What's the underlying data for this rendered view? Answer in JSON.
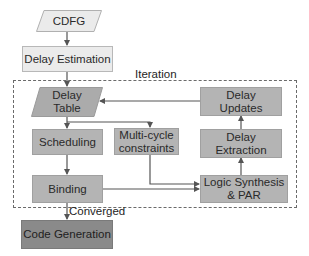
{
  "diagram": {
    "colors": {
      "light_fill": "#ebebeb",
      "mid_fill": "#b4b4b4",
      "dark_fill": "#8a8a8a",
      "line": "#555555",
      "frame": "#6a6a6a"
    },
    "nodes": {
      "cdfg": {
        "label": "CDFG",
        "shape": "parallelogram"
      },
      "delay_estimation": {
        "label": "Delay Estimation",
        "shape": "rectangle"
      },
      "delay_table": {
        "label_line1": "Delay",
        "label_line2": "Table",
        "shape": "parallelogram"
      },
      "delay_updates": {
        "label_line1": "Delay",
        "label_line2": "Updates",
        "shape": "rectangle"
      },
      "scheduling": {
        "label": "Scheduling",
        "shape": "rectangle"
      },
      "multicycle": {
        "label_line1": "Multi-cycle",
        "label_line2": "constraints",
        "shape": "rectangle"
      },
      "delay_extraction": {
        "label_line1": "Delay",
        "label_line2": "Extraction",
        "shape": "rectangle"
      },
      "binding": {
        "label": "Binding",
        "shape": "rectangle"
      },
      "logic_synthesis": {
        "label_line1": "Logic Synthesis",
        "label_line2": "& PAR",
        "shape": "rectangle"
      },
      "code_generation": {
        "label": "Code Generation",
        "shape": "rectangle"
      }
    },
    "labels": {
      "iteration": "Iteration",
      "converged": "Converged"
    },
    "edges": [
      {
        "from": "CDFG",
        "to": "Delay Estimation"
      },
      {
        "from": "Delay Estimation",
        "to": "Delay Table"
      },
      {
        "from": "Delay Table",
        "to": "Scheduling"
      },
      {
        "from": "Delay Table",
        "to": "Multi-cycle constraints"
      },
      {
        "from": "Scheduling",
        "to": "Binding"
      },
      {
        "from": "Multi-cycle constraints",
        "to": "Logic Synthesis & PAR"
      },
      {
        "from": "Binding",
        "to": "Logic Synthesis & PAR"
      },
      {
        "from": "Logic Synthesis & PAR",
        "to": "Delay Extraction"
      },
      {
        "from": "Delay Extraction",
        "to": "Delay Updates"
      },
      {
        "from": "Delay Updates",
        "to": "Delay Table"
      },
      {
        "from": "Binding",
        "to": "Code Generation",
        "label": "Converged"
      }
    ]
  }
}
